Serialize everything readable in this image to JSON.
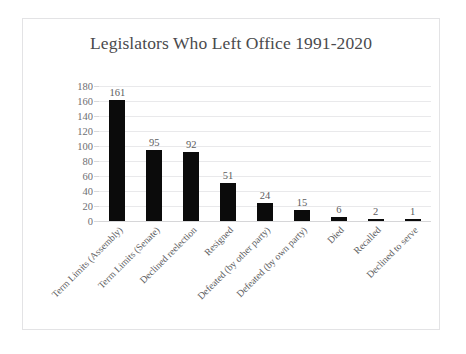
{
  "chart_data": {
    "type": "bar",
    "title": "Legislators Who Left Office 1991-2020",
    "xlabel": "",
    "ylabel": "",
    "ylim": [
      0,
      180
    ],
    "ytick_step": 20,
    "yticks": [
      180,
      160,
      140,
      120,
      100,
      80,
      60,
      40,
      20,
      0
    ],
    "grid": true,
    "legend": "none",
    "bar_color": "#0b0b0b",
    "gridline_color": "#e9e9eb",
    "text_color": "#5d5d61",
    "categories": [
      "Term Limits (Assembly)",
      "Term Limits (Senate)",
      "Declined reelection",
      "Resigned",
      "Defeated (by other party)",
      "Defeated (by own party)",
      "Died",
      "Recalled",
      "Declined to serve"
    ],
    "values": [
      161,
      95,
      92,
      51,
      24,
      15,
      6,
      2,
      1
    ],
    "data_labels": [
      "161",
      "95",
      "92",
      "51",
      "24",
      "15",
      "6",
      "2",
      "1"
    ]
  }
}
